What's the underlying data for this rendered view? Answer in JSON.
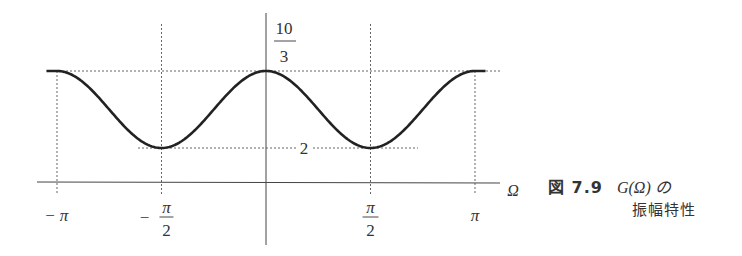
{
  "chart_data": {
    "type": "line",
    "title": "",
    "xlabel": "Ω",
    "ylabel": "",
    "function_description": "periodic amplitude characteristic with maxima at 0 and ±π, minima at ±π/2",
    "xlim": [
      -3.3,
      3.3
    ],
    "ylim": [
      0,
      3.9
    ],
    "x_ticks": [
      {
        "value": -3.14159,
        "label_num": "π",
        "label_den": "",
        "sign": "−"
      },
      {
        "value": -1.5708,
        "label_num": "π",
        "label_den": "2",
        "sign": "−"
      },
      {
        "value": 1.5708,
        "label_num": "π",
        "label_den": "2",
        "sign": ""
      },
      {
        "value": 3.14159,
        "label_num": "π",
        "label_den": "",
        "sign": ""
      }
    ],
    "y_levels": [
      {
        "value": 3.3333,
        "label_num": "10",
        "label_den": "3"
      },
      {
        "value": 2,
        "label_num": "2",
        "label_den": ""
      }
    ],
    "series": [
      {
        "name": "G(Ω) amplitude",
        "max": 3.3333,
        "min": 2,
        "x_range": [
          -3.3,
          3.3
        ]
      }
    ],
    "grid": false,
    "legend": "none"
  },
  "caption": {
    "figure_number": "図 7.9",
    "text_line1": "G(Ω) の",
    "text_line2": "振幅特性"
  }
}
